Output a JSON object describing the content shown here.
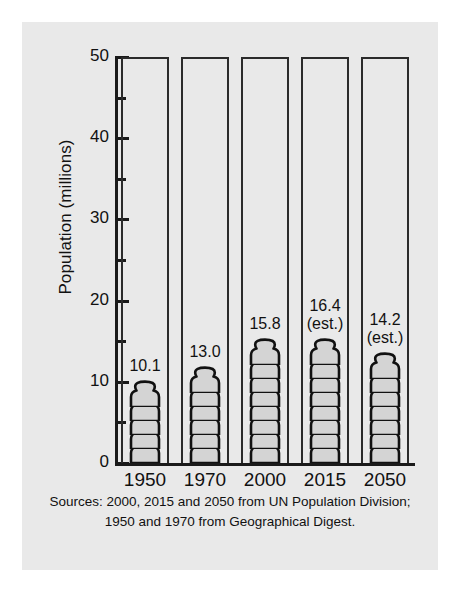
{
  "chart_data": {
    "type": "bar",
    "title": "",
    "subtitle": "",
    "xlabel": "",
    "ylabel": "Population (millions)",
    "categories": [
      "1950",
      "1970",
      "2000",
      "2015",
      "2050"
    ],
    "values": [
      10.1,
      13.0,
      15.8,
      16.4,
      14.2
    ],
    "value_labels": [
      "10.1",
      "13.0",
      "15.8",
      "16.4",
      "14.2"
    ],
    "value_qualifiers": [
      "",
      "",
      "",
      "(est.)",
      "(est.)"
    ],
    "series": [
      {
        "name": "Population",
        "values": [
          10.1,
          13.0,
          15.8,
          16.4,
          14.2
        ]
      }
    ],
    "ylim": [
      0,
      50
    ],
    "y_major_ticks": [
      0,
      10,
      20,
      30,
      40,
      50
    ],
    "y_major_tick_labels": [
      "0",
      "10",
      "20",
      "30",
      "40",
      "50"
    ],
    "y_minor_ticks": [
      5,
      15,
      25,
      35,
      45
    ],
    "grid": false,
    "legend": "none",
    "pictogram": {
      "symbol": "person-icon",
      "units_per_symbol": 2,
      "symbol_counts": [
        5,
        6,
        8,
        8,
        7
      ]
    },
    "annotations": [
      "Sources: 2000, 2015 and 2050 from UN Population Division;",
      "1950 and 1970 from Geographical Digest."
    ]
  },
  "axis": {
    "y_title": "Population (millions)",
    "y_labels": [
      "50",
      "40",
      "30",
      "20",
      "10",
      "0"
    ],
    "x_labels": [
      "1950",
      "1970",
      "2000",
      "2015",
      "2050"
    ]
  },
  "bars": [
    {
      "category": "1950",
      "value_text": "10.1",
      "qualifier": ""
    },
    {
      "category": "1970",
      "value_text": "13.0",
      "qualifier": ""
    },
    {
      "category": "2000",
      "value_text": "15.8",
      "qualifier": ""
    },
    {
      "category": "2015",
      "value_text": "16.4",
      "qualifier": "(est.)"
    },
    {
      "category": "2050",
      "value_text": "14.2",
      "qualifier": "(est.)"
    }
  ],
  "source": {
    "line1": "Sources: 2000, 2015 and 2050 from UN Population Division;",
    "line2": "1950 and 1970 from Geographical Digest."
  },
  "colors": {
    "panel_background": "#e9e9e9",
    "page_background": "#ffffff",
    "axis": "#1a1a1a",
    "column_outline": "#2b2b2b",
    "symbol_fill": "#d4d4d4",
    "symbol_outline": "#111111",
    "text": "#111111"
  }
}
